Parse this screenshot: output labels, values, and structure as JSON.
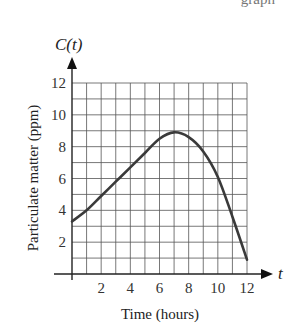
{
  "page": {
    "top_fragment": "graph"
  },
  "chart_data": {
    "type": "line",
    "title": "",
    "function_label": "C(t)",
    "x_axis_symbol": "t",
    "xlabel": "Time (hours)",
    "ylabel": "Particulate matter (ppm)",
    "xlim": [
      0,
      12
    ],
    "ylim": [
      0,
      12
    ],
    "x_ticks": [
      2,
      4,
      6,
      8,
      10,
      12
    ],
    "y_ticks": [
      2,
      4,
      6,
      8,
      10,
      12
    ],
    "x_tick_labels": [
      "2",
      "4",
      "6",
      "8",
      "10",
      "12"
    ],
    "y_tick_labels": [
      "2",
      "4",
      "6",
      "8",
      "10",
      "12"
    ],
    "grid": true,
    "grid_step": 1,
    "legend": null,
    "x": [
      0,
      1,
      2,
      3,
      4,
      5,
      6,
      7,
      8,
      9,
      10,
      11,
      12
    ],
    "values": [
      3.3,
      4.0,
      4.9,
      5.8,
      6.7,
      7.6,
      8.5,
      8.9,
      8.6,
      7.7,
      6.1,
      3.6,
      0.9
    ],
    "series": [
      {
        "name": "C(t)",
        "x": [
          0,
          1,
          2,
          3,
          4,
          5,
          6,
          7,
          8,
          9,
          10,
          11,
          12
        ],
        "values": [
          3.3,
          4.0,
          4.9,
          5.8,
          6.7,
          7.6,
          8.5,
          8.9,
          8.6,
          7.7,
          6.1,
          3.6,
          0.9
        ]
      }
    ],
    "annotations": [
      "maximum near t = 7 at about 8.9 ppm"
    ],
    "colors": {
      "curve": "#3a3a3a",
      "grid": "#555555",
      "axis": "#222222"
    }
  }
}
